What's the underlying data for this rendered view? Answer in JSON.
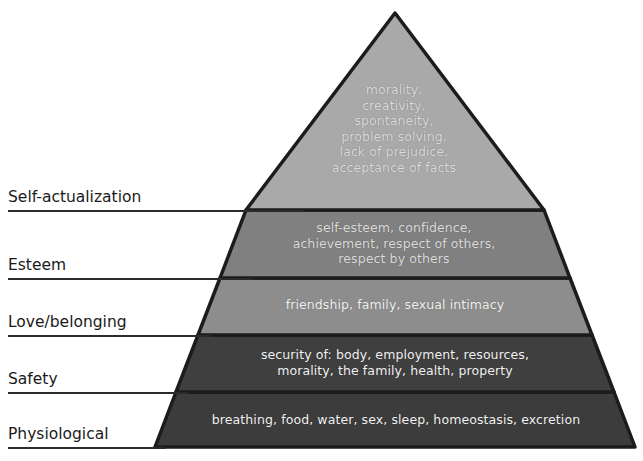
{
  "diagram": {
    "type": "pyramid",
    "background_color": "#ffffff",
    "outline_color": "#1c1c1c",
    "label_color": "#1a1a1a",
    "tier_text_color": "#e2e2e2"
  },
  "tiers": [
    {
      "label": "Self-actualization",
      "fill": "#3c3c3c",
      "content": "morality,\ncreativity,\nspontaneity,\nproblem solving,\nlack of prejudice,\nacceptance of facts",
      "items": [
        "morality",
        "creativity",
        "spontaneity",
        "problem solving",
        "lack of prejudice",
        "acceptance of facts"
      ]
    },
    {
      "label": "Esteem",
      "fill": "#3f3f3f",
      "content": "self-esteem, confidence,\nachievement, respect of others,\nrespect by others",
      "items": [
        "self-esteem",
        "confidence",
        "achievement",
        "respect of others",
        "respect by others"
      ]
    },
    {
      "label": "Love/belonging",
      "fill": "#8d8d8d",
      "content": "friendship, family, sexual intimacy",
      "items": [
        "friendship",
        "family",
        "sexual intimacy"
      ]
    },
    {
      "label": "Safety",
      "fill": "#808080",
      "content": "security of: body, employment, resources,\nmorality, the family, health, property",
      "items": [
        "security of: body",
        "employment",
        "resources",
        "morality",
        "the family",
        "health",
        "property"
      ]
    },
    {
      "label": "Physiological",
      "fill": "#a9a9a9",
      "content": "breathing, food, water, sex, sleep, homeostasis, excretion",
      "items": [
        "breathing",
        "food",
        "water",
        "sex",
        "sleep",
        "homeostasis",
        "excretion"
      ]
    }
  ]
}
